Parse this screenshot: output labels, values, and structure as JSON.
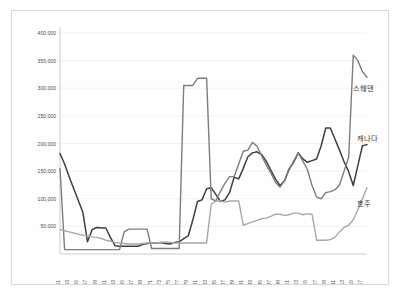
{
  "chart_data": {
    "type": "line",
    "title": "",
    "subtitle": "",
    "xlabel": "",
    "ylabel": "",
    "ylim": [
      0,
      400000
    ],
    "ytick_labels": [
      "400,000",
      "350,000",
      "300,000",
      "250,000",
      "200,000",
      "150,000",
      "100,000",
      "50,000"
    ],
    "ytick_values": [
      400000,
      350000,
      300000,
      250000,
      200000,
      150000,
      100000,
      50000
    ],
    "grid": true,
    "legend_position": "right-inline-labels",
    "x": [
      1951,
      1952,
      1953,
      1954,
      1955,
      1956,
      1957,
      1958,
      1959,
      1960,
      1961,
      1962,
      1963,
      1964,
      1965,
      1966,
      1967,
      1968,
      1969,
      1970,
      1971,
      1972,
      1973,
      1974,
      1975,
      1976,
      1977,
      1978,
      1979,
      1980,
      1981,
      1982,
      1983,
      1984,
      1985,
      1986,
      1987,
      1988,
      1989,
      1990,
      1991,
      1992,
      1993,
      1994,
      1995,
      1996,
      1997,
      1998,
      1999,
      2000,
      2001,
      2002,
      2003,
      2004,
      2005,
      2006,
      2007,
      2008,
      2009,
      2010,
      2011,
      2012,
      2013,
      2014,
      2015,
      2016,
      2017,
      2018
    ],
    "xtick_labels": [
      "1951",
      "1953",
      "1955",
      "1957",
      "1959",
      "1961",
      "1963",
      "1965",
      "1967",
      "1969",
      "1971",
      "1973",
      "1975",
      "1977",
      "1979",
      "1981",
      "1983",
      "1985",
      "1987",
      "1989",
      "1991",
      "1993",
      "1995",
      "1997",
      "1999",
      "2001",
      "2003",
      "2005",
      "2007",
      "2009",
      "2011",
      "2013",
      "2015",
      "2017"
    ],
    "series": [
      {
        "name": "캐나다",
        "color": "#3f3f3f",
        "width": 1.5,
        "values": [
          182000,
          163000,
          140000,
          118000,
          97000,
          75000,
          22000,
          44000,
          48000,
          47000,
          47000,
          30000,
          15000,
          14000,
          14000,
          14000,
          14000,
          14000,
          17000,
          19000,
          20000,
          20000,
          21000,
          19000,
          18000,
          21000,
          22000,
          28000,
          33000,
          62000,
          95000,
          98000,
          118000,
          120000,
          108000,
          95000,
          98000,
          111000,
          139000,
          136000,
          155000,
          176000,
          183000,
          185000,
          180000,
          168000,
          152000,
          136000,
          124000,
          132000,
          154000,
          166000,
          183000,
          172000,
          166000,
          169000,
          172000,
          196000,
          228000,
          228000,
          208000,
          188000,
          167000,
          149000,
          124000,
          160000,
          196000,
          198000
        ]
      },
      {
        "name": "스웨덴",
        "color": "#7d7d7d",
        "width": 1.4,
        "values": [
          155000,
          8000,
          8000,
          8000,
          8000,
          8000,
          8000,
          8000,
          8000,
          8000,
          8000,
          8000,
          8000,
          8000,
          40000,
          45000,
          45000,
          45000,
          45000,
          45000,
          10000,
          10000,
          10000,
          10000,
          10000,
          10000,
          10000,
          305000,
          305000,
          305000,
          318000,
          318000,
          318000,
          100000,
          96000,
          113000,
          128000,
          140000,
          140000,
          163000,
          186000,
          188000,
          202000,
          195000,
          178000,
          161000,
          147000,
          130000,
          121000,
          133000,
          152000,
          168000,
          183000,
          168000,
          153000,
          124000,
          103000,
          100000,
          111000,
          113000,
          116000,
          125000,
          150000,
          175000,
          360000,
          350000,
          330000,
          320000
        ]
      },
      {
        "name": "호주",
        "color": "#a8a8a8",
        "width": 1.4,
        "values": [
          44000,
          42000,
          40000,
          38000,
          36000,
          34000,
          33000,
          31000,
          30000,
          28000,
          25000,
          23000,
          21000,
          20000,
          19000,
          18000,
          18000,
          18000,
          19000,
          20000,
          20000,
          20000,
          21000,
          22000,
          21000,
          20000,
          20000,
          20000,
          20000,
          20000,
          20000,
          20000,
          20000,
          90000,
          96000,
          96000,
          94000,
          96000,
          96000,
          96000,
          52000,
          55000,
          58000,
          61000,
          64000,
          65000,
          68000,
          72000,
          72000,
          70000,
          71000,
          74000,
          74000,
          71000,
          73000,
          72000,
          25000,
          25000,
          25000,
          26000,
          30000,
          40000,
          48000,
          52000,
          62000,
          80000,
          100000,
          120000
        ]
      }
    ],
    "annotations": [
      {
        "label": "스웨덴",
        "x": 2014,
        "y": 295000
      },
      {
        "label": "캐나다",
        "x": 2015,
        "y": 205000
      },
      {
        "label": "호주",
        "x": 2015,
        "y": 86000
      }
    ]
  }
}
